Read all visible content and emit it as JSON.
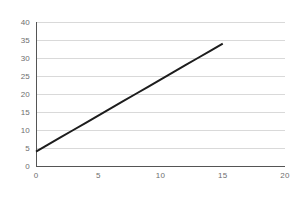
{
  "chart_data": {
    "type": "line",
    "title": "",
    "subtitle": "",
    "xlabel": "",
    "ylabel": "",
    "xlim": [
      0,
      20
    ],
    "ylim": [
      0,
      40
    ],
    "xticks": [
      0,
      5,
      10,
      15,
      20
    ],
    "yticks": [
      0,
      5,
      10,
      15,
      20,
      25,
      30,
      35,
      40
    ],
    "xtick_labels": [
      "0",
      "5",
      "10",
      "15",
      "20"
    ],
    "ytick_labels": [
      "0",
      "5",
      "10",
      "15",
      "20",
      "25",
      "30",
      "35",
      "40"
    ],
    "grid": {
      "horizontal": true,
      "vertical": false,
      "color": "#d9d9d9"
    },
    "legend": {
      "visible": false,
      "position": "none",
      "entries": []
    },
    "annotations": [],
    "background_color": "#ffffff",
    "axis_color": "#555555",
    "tick_label_color": "#6e6e6e",
    "series": [
      {
        "name": "series-1",
        "type": "line",
        "color": "#1d1d1d",
        "line_width": 2,
        "x": [
          0,
          15
        ],
        "y": [
          4,
          34
        ],
        "points": [
          {
            "x": 0,
            "y": 4
          },
          {
            "x": 1,
            "y": 6
          },
          {
            "x": 2,
            "y": 8
          },
          {
            "x": 3,
            "y": 10
          },
          {
            "x": 4,
            "y": 12
          },
          {
            "x": 5,
            "y": 14
          },
          {
            "x": 6,
            "y": 16
          },
          {
            "x": 7,
            "y": 18
          },
          {
            "x": 8,
            "y": 20
          },
          {
            "x": 9,
            "y": 22
          },
          {
            "x": 10,
            "y": 24
          },
          {
            "x": 11,
            "y": 26
          },
          {
            "x": 12,
            "y": 28
          },
          {
            "x": 13,
            "y": 30
          },
          {
            "x": 14,
            "y": 32
          },
          {
            "x": 15,
            "y": 34
          }
        ],
        "slope": 2,
        "intercept": 4,
        "markers": false
      }
    ]
  },
  "plot_geometry": {
    "left": 36,
    "right": 285,
    "top": 22,
    "bottom": 166
  }
}
